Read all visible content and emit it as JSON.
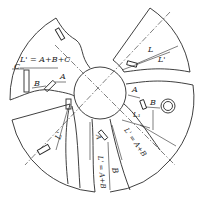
{
  "diagram": {
    "type": "sectored-disc-dimension-drawing",
    "colors": {
      "stroke": "#2a2a2a",
      "background": "#ffffff"
    },
    "labels": {
      "top_left_formula": "L' = A+B+C",
      "top_left_C": "C",
      "top_left_B": "B",
      "top_left_A": "A",
      "top_right_L": "L",
      "top_right_Lp": "L'",
      "right_A": "A",
      "right_B": "B",
      "right_L1": "L₁",
      "right_formula": "L' = A+B",
      "bottom_A": "A",
      "bottom_formula": "L' = A+B",
      "bottom_B": "B",
      "left_Lp": "L'"
    }
  }
}
